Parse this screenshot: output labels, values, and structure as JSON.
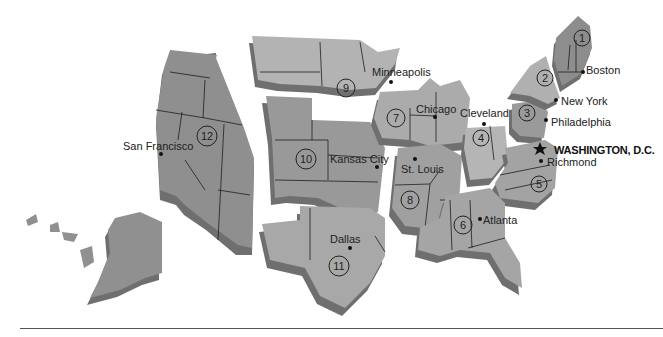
{
  "districts": [
    {
      "number": "1",
      "city": "Boston"
    },
    {
      "number": "2",
      "city": "New York"
    },
    {
      "number": "3",
      "city": "Philadelphia"
    },
    {
      "number": "4",
      "city": "Cleveland"
    },
    {
      "number": "5",
      "city": "Richmond"
    },
    {
      "number": "6",
      "city": "Atlanta"
    },
    {
      "number": "7",
      "city": "Chicago"
    },
    {
      "number": "8",
      "city": "St. Louis"
    },
    {
      "number": "9",
      "city": "Minneapolis"
    },
    {
      "number": "10",
      "city": "Kansas City"
    },
    {
      "number": "11",
      "city": "Dallas"
    },
    {
      "number": "12",
      "city": "San Francisco"
    }
  ],
  "capital": {
    "label": "WASHINGTON, D.C.",
    "icon": "star-icon"
  },
  "colors": {
    "light_region": "#b9b9b9",
    "mid_region": "#9d9d9d",
    "dark_region": "#858585",
    "shadow": "#6f6f6f",
    "background": "#ffffff"
  }
}
